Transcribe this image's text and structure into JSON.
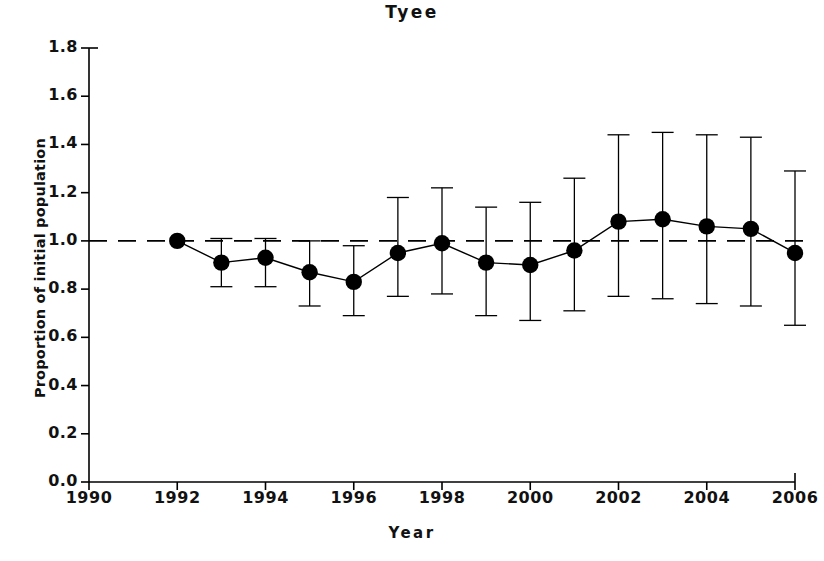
{
  "chart_data": {
    "type": "line",
    "title": "Tyee",
    "xlabel": "Year",
    "ylabel": "Proportion of initial population",
    "x": [
      1992,
      1993,
      1994,
      1995,
      1996,
      1997,
      1998,
      1999,
      2000,
      2001,
      2002,
      2003,
      2004,
      2005,
      2006
    ],
    "values": [
      1.0,
      0.91,
      0.93,
      0.87,
      0.83,
      0.95,
      0.99,
      0.91,
      0.9,
      0.96,
      1.08,
      1.09,
      1.06,
      1.05,
      0.95
    ],
    "error_upper": [
      1.0,
      1.01,
      1.01,
      1.0,
      0.98,
      1.18,
      1.22,
      1.14,
      1.16,
      1.26,
      1.44,
      1.45,
      1.44,
      1.43,
      1.29
    ],
    "error_lower": [
      1.0,
      0.81,
      0.81,
      0.73,
      0.69,
      0.77,
      0.78,
      0.69,
      0.67,
      0.71,
      0.77,
      0.76,
      0.74,
      0.73,
      0.65
    ],
    "xlim": [
      1990,
      2006
    ],
    "ylim": [
      0.0,
      1.8
    ],
    "xticks": [
      1990,
      1992,
      1994,
      1996,
      1998,
      2000,
      2002,
      2004,
      2006
    ],
    "xtick_labels": [
      "1990",
      "1992",
      "1994",
      "1996",
      "1998",
      "2000",
      "2002",
      "2004",
      "2006"
    ],
    "yticks": [
      0.0,
      0.2,
      0.4,
      0.6,
      0.8,
      1.0,
      1.2,
      1.4,
      1.6,
      1.8
    ],
    "ytick_labels": [
      "0.0",
      "0.2",
      "0.4",
      "0.6",
      "0.8",
      "1.0",
      "1.2",
      "1.4",
      "1.6",
      "1.8"
    ],
    "reference_line": {
      "y": 1.0,
      "style": "dashed"
    },
    "grid": false,
    "legend": null,
    "marker": "filled-circle",
    "series_color": "#000000",
    "axis_color": "#000000",
    "background_color": "#ffffff"
  }
}
